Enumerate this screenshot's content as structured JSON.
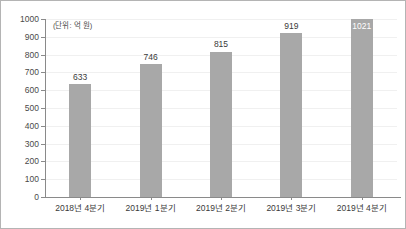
{
  "chart_data": {
    "type": "bar",
    "title": "",
    "subtitle": "",
    "annotation": "(단위: 억 원)",
    "categories": [
      "2018년 4분기",
      "2019년 1분기",
      "2019년 2분기",
      "2019년 3분기",
      "2019년 4분기"
    ],
    "values": [
      633,
      746,
      815,
      919,
      1021
    ],
    "value_labels": [
      "633",
      "746",
      "815",
      "919",
      "1021"
    ],
    "xlabel": "",
    "ylabel": "",
    "ylim": [
      0,
      1000
    ],
    "ytick_step": 100,
    "ytick_labels": [
      "1000",
      "900",
      "800",
      "700",
      "600",
      "500",
      "400",
      "300",
      "200",
      "100",
      "0"
    ],
    "ytick_values": [
      1000,
      900,
      800,
      700,
      600,
      500,
      400,
      300,
      200,
      100,
      0
    ],
    "grid": true,
    "legend": false,
    "legend_position": "none",
    "bar_color": "#a8a8a8",
    "axis_color": "#8a8a8a",
    "grid_color": "#f0f0f0",
    "label_color": "#3a3a3a",
    "inside_label_color": "#ffffff",
    "border_color": "#b4b4b4",
    "background": "#ffffff"
  }
}
